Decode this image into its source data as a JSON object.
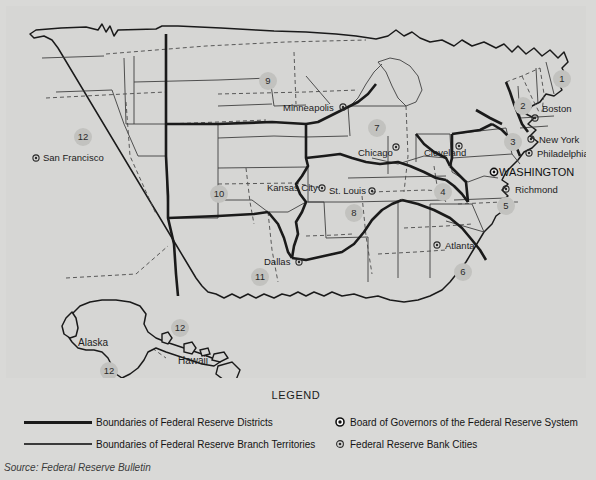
{
  "map": {
    "title": "Federal Reserve Districts Map",
    "districts": [
      {
        "number": "1",
        "x": 556,
        "y": 73,
        "bank": "Boston"
      },
      {
        "number": "2",
        "x": 517,
        "y": 100,
        "bank": "New York"
      },
      {
        "number": "3",
        "x": 507,
        "y": 136,
        "bank": "Philadelphia"
      },
      {
        "number": "4",
        "x": 437,
        "y": 186,
        "bank": "Cleveland"
      },
      {
        "number": "5",
        "x": 500,
        "y": 200,
        "bank": "Richmond"
      },
      {
        "number": "6",
        "x": 457,
        "y": 266,
        "bank": "Atlanta"
      },
      {
        "number": "7",
        "x": 371,
        "y": 122,
        "bank": "Chicago"
      },
      {
        "number": "8",
        "x": 348,
        "y": 207,
        "bank": "St. Louis"
      },
      {
        "number": "9",
        "x": 262,
        "y": 75,
        "bank": "Minneapolis"
      },
      {
        "number": "10",
        "x": 213,
        "y": 188,
        "bank": "Kansas City"
      },
      {
        "number": "11",
        "x": 254,
        "y": 271,
        "bank": "Dallas"
      },
      {
        "number": "12",
        "x": 77,
        "y": 131,
        "bank": "San Francisco"
      },
      {
        "number": "12",
        "x": 174,
        "y": 322,
        "bank": "Hawaii"
      },
      {
        "number": "12",
        "x": 103,
        "y": 365,
        "bank": "Alaska"
      }
    ],
    "cities": [
      {
        "name": "Boston",
        "label_x": 536,
        "label_y": 106,
        "anchor": "start",
        "dot_x": 529,
        "dot_y": 112
      },
      {
        "name": "New York",
        "label_x": 533,
        "label_y": 137,
        "anchor": "start",
        "dot_x": 525,
        "dot_y": 133
      },
      {
        "name": "Philadelphia",
        "label_x": 531,
        "label_y": 151,
        "anchor": "start",
        "dot_x": 523,
        "dot_y": 147
      },
      {
        "name": "Richmond",
        "label_x": 509,
        "label_y": 187,
        "anchor": "start",
        "dot_x": 500,
        "dot_y": 183
      },
      {
        "name": "Cleveland",
        "label_x": 418,
        "label_y": 150,
        "anchor": "start",
        "dot_x": 453,
        "dot_y": 140
      },
      {
        "name": "Atlanta",
        "label_x": 439,
        "label_y": 243,
        "anchor": "start",
        "dot_x": 431,
        "dot_y": 239
      },
      {
        "name": "Chicago",
        "label_x": 352,
        "label_y": 150,
        "anchor": "start",
        "dot_x": 390,
        "dot_y": 141
      },
      {
        "name": "St. Louis",
        "label_x": 323,
        "label_y": 188,
        "anchor": "start",
        "dot_x": 366,
        "dot_y": 185
      },
      {
        "name": "Minneapolis",
        "label_x": 277,
        "label_y": 105,
        "anchor": "start",
        "dot_x": 337,
        "dot_y": 101
      },
      {
        "name": "Kansas City",
        "label_x": 261,
        "label_y": 185,
        "anchor": "start",
        "dot_x": 316,
        "dot_y": 182
      },
      {
        "name": "Dallas",
        "label_x": 258,
        "label_y": 259,
        "anchor": "start",
        "dot_x": 293,
        "dot_y": 256
      },
      {
        "name": "San Francisco",
        "label_x": 37,
        "label_y": 155,
        "anchor": "start",
        "dot_x": 30,
        "dot_y": 152
      }
    ],
    "capital": {
      "name": "WASHINGTON",
      "label_x": 493,
      "label_y": 170,
      "dot_x": 488,
      "dot_y": 166
    },
    "geo_labels": [
      {
        "name": "Alaska",
        "x": 72,
        "y": 340
      },
      {
        "name": "Hawaii",
        "x": 172,
        "y": 358
      }
    ]
  },
  "legend": {
    "title": "LEGEND",
    "rows_left": [
      {
        "swatch": "thick-line",
        "label": "Boundaries of Federal Reserve Districts"
      },
      {
        "swatch": "thin-line",
        "label": "Boundaries of Federal Reserve Branch Territories"
      }
    ],
    "rows_right": [
      {
        "marker": "board-of-governors-marker",
        "label": "Board of Governors of the Federal Reserve System"
      },
      {
        "marker": "bank-city-marker",
        "label": "Federal Reserve Bank Cities"
      }
    ]
  },
  "source": "Source: Federal Reserve Bulletin",
  "colors": {
    "paper": "#d6d6d4",
    "ink": "#1a1a1a",
    "badge": "#c2c2bf"
  }
}
